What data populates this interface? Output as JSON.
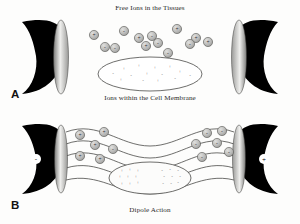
{
  "figure": {
    "title_a": "Free Ions in the Tissues",
    "caption_a": "Ions within the Cell Membrane",
    "caption_b": "Dipole Action",
    "label_a": "A",
    "label_b": "B"
  },
  "colors": {
    "background": "#fdfdfc",
    "cone_body": "#000000",
    "cone_face_light": "#f2f2f0",
    "cone_face_dark": "#8a8a88",
    "ion_fill": "#b9b9b7",
    "ion_stroke": "#555553",
    "field_line": "#4a4a48",
    "membrane_stroke": "#4a4a48",
    "text": "#2a2a2a"
  },
  "panel_a": {
    "transducers": [
      {
        "name": "left-transducer",
        "side": "left",
        "polarity": ""
      },
      {
        "name": "right-transducer",
        "side": "right",
        "polarity": ""
      }
    ],
    "free_ions": [
      {
        "x": 94,
        "y": 35,
        "charge": "+"
      },
      {
        "x": 124,
        "y": 31,
        "charge": "-"
      },
      {
        "x": 139,
        "y": 38,
        "charge": "+"
      },
      {
        "x": 152,
        "y": 36,
        "charge": "-"
      },
      {
        "x": 158,
        "y": 43,
        "charge": "-"
      },
      {
        "x": 146,
        "y": 46,
        "charge": "+"
      },
      {
        "x": 105,
        "y": 47,
        "charge": "-"
      },
      {
        "x": 115,
        "y": 48,
        "charge": "-"
      },
      {
        "x": 177,
        "y": 29,
        "charge": "+"
      },
      {
        "x": 196,
        "y": 38,
        "charge": "+"
      },
      {
        "x": 190,
        "y": 44,
        "charge": "-"
      },
      {
        "x": 208,
        "y": 42,
        "charge": "+"
      },
      {
        "x": 168,
        "y": 53,
        "charge": "-"
      }
    ],
    "membrane_ions": [
      {
        "x": 124,
        "y": 70,
        "charge": "+"
      },
      {
        "x": 139,
        "y": 67,
        "charge": "+"
      },
      {
        "x": 155,
        "y": 69,
        "charge": "+"
      },
      {
        "x": 170,
        "y": 68,
        "charge": "+"
      },
      {
        "x": 113,
        "y": 75,
        "charge": "-"
      },
      {
        "x": 131,
        "y": 77,
        "charge": "-"
      },
      {
        "x": 147,
        "y": 75,
        "charge": "+"
      },
      {
        "x": 162,
        "y": 76,
        "charge": "-"
      },
      {
        "x": 180,
        "y": 73,
        "charge": "+"
      },
      {
        "x": 121,
        "y": 81,
        "charge": "+"
      },
      {
        "x": 143,
        "y": 82,
        "charge": "-"
      },
      {
        "x": 158,
        "y": 82,
        "charge": "+"
      },
      {
        "x": 175,
        "y": 80,
        "charge": "-"
      },
      {
        "x": 190,
        "y": 77,
        "charge": "-"
      }
    ]
  },
  "panel_b": {
    "transducers": [
      {
        "name": "left-transducer",
        "side": "left",
        "polarity": "-"
      },
      {
        "name": "right-transducer",
        "side": "right",
        "polarity": "+"
      }
    ],
    "positive_ions": [
      {
        "x": 80,
        "y": 135,
        "charge": "+"
      },
      {
        "x": 104,
        "y": 132,
        "charge": "+"
      },
      {
        "x": 95,
        "y": 145,
        "charge": "+"
      },
      {
        "x": 113,
        "y": 149,
        "charge": "-"
      },
      {
        "x": 80,
        "y": 156,
        "charge": "+"
      },
      {
        "x": 100,
        "y": 159,
        "charge": "+"
      }
    ],
    "negative_ions": [
      {
        "x": 196,
        "y": 144,
        "charge": "-"
      },
      {
        "x": 207,
        "y": 133,
        "charge": "-"
      },
      {
        "x": 217,
        "y": 143,
        "charge": "-"
      },
      {
        "x": 202,
        "y": 157,
        "charge": "-"
      },
      {
        "x": 222,
        "y": 131,
        "charge": "-"
      },
      {
        "x": 229,
        "y": 152,
        "charge": "-"
      }
    ],
    "dipole_cell": {
      "positive_side": "+",
      "negative_side": "-",
      "positive_marks": 9,
      "negative_marks": 9
    }
  }
}
